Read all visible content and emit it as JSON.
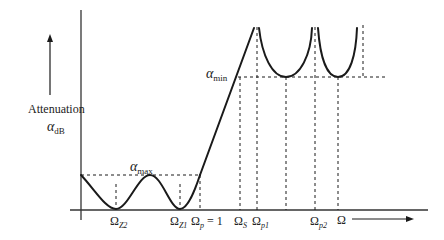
{
  "diagram": {
    "type": "filter-attenuation-response",
    "y_axis_label": "Attenuation",
    "y_axis_symbol": {
      "base": "α",
      "sub": "dB"
    },
    "x_axis_symbol": "Ω",
    "annotations": {
      "alpha_max": {
        "base": "α",
        "sub": "max"
      },
      "alpha_min": {
        "base": "α",
        "sub": "min"
      }
    },
    "x_labels": [
      {
        "id": "omega_z2",
        "base": "Ω",
        "sub": "Z2",
        "suffix": ""
      },
      {
        "id": "omega_z1",
        "base": "Ω",
        "sub": "Z1",
        "suffix": ""
      },
      {
        "id": "omega_p",
        "base": "Ω",
        "sub": "p",
        "suffix": " = 1"
      },
      {
        "id": "omega_s",
        "base": "Ω",
        "sub": "S",
        "suffix": ""
      },
      {
        "id": "omega_p1",
        "base": "Ω",
        "sub": "p1",
        "suffix": ""
      },
      {
        "id": "omega_p2",
        "base": "Ω",
        "sub": "p2",
        "suffix": ""
      }
    ],
    "colors": {
      "line": "#1a1a1a",
      "text": "#222222",
      "background": "#ffffff"
    }
  }
}
